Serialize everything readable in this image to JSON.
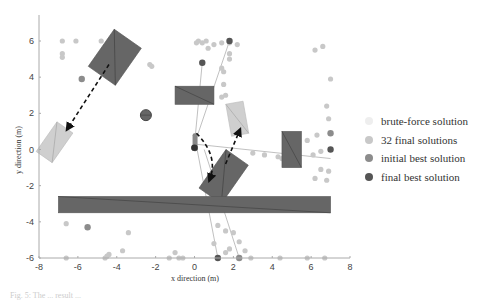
{
  "chart_data": {
    "type": "scatter",
    "title": "",
    "xlabel": "x direction (m)",
    "ylabel": "y direction (m)",
    "xlim": [
      -8,
      8
    ],
    "ylim": [
      -6,
      6
    ],
    "xticks": [
      "-8",
      "-6",
      "-4",
      "-2",
      "0",
      "2",
      "4",
      "6",
      "8"
    ],
    "yticks": [
      "-6",
      "-4",
      "-2",
      "0",
      "2",
      "4",
      "6"
    ],
    "grid": false,
    "legend_position": "right",
    "legend": [
      {
        "label": "brute-force solution",
        "color": "#eeeeee"
      },
      {
        "label": "32 final solutions",
        "color": "#c8c8c8"
      },
      {
        "label": "initial best solution",
        "color": "#8c8c8c"
      },
      {
        "label": "final best solution",
        "color": "#555555"
      }
    ],
    "series": [
      {
        "name": "32 final solutions",
        "points": [
          [
            -6.8,
            6.0
          ],
          [
            -6.1,
            6.0
          ],
          [
            -6.8,
            5.3
          ],
          [
            -6.8,
            5.1
          ],
          [
            -4.8,
            6.0
          ],
          [
            -4.3,
            6.0
          ],
          [
            -3.5,
            6.0
          ],
          [
            -2.3,
            4.7
          ],
          [
            -2.2,
            4.6
          ],
          [
            0.1,
            5.9
          ],
          [
            0.2,
            6.0
          ],
          [
            0.4,
            5.9
          ],
          [
            0.6,
            6.0
          ],
          [
            0.7,
            5.6
          ],
          [
            1.0,
            5.8
          ],
          [
            1.4,
            5.9
          ],
          [
            0.4,
            4.8
          ],
          [
            1.4,
            4.5
          ],
          [
            1.5,
            4.3
          ],
          [
            1.5,
            3.6
          ],
          [
            1.6,
            3.0
          ],
          [
            1.4,
            2.9
          ],
          [
            1.8,
            5.9
          ],
          [
            2.2,
            5.8
          ],
          [
            1.8,
            5.3
          ],
          [
            1.8,
            5.0
          ],
          [
            6.2,
            5.5
          ],
          [
            6.6,
            5.7
          ],
          [
            7.0,
            3.9
          ],
          [
            6.8,
            2.4
          ],
          [
            6.9,
            1.7
          ],
          [
            3.0,
            -0.2
          ],
          [
            3.6,
            -0.3
          ],
          [
            4.3,
            -0.4
          ],
          [
            4.5,
            -0.5
          ],
          [
            6.1,
            -0.3
          ],
          [
            6.5,
            -0.1
          ],
          [
            6.3,
            0.8
          ],
          [
            5.8,
            0.5
          ],
          [
            6.9,
            -1.2
          ],
          [
            6.8,
            -1.7
          ],
          [
            6.2,
            -1.6
          ],
          [
            6.5,
            -1.1
          ],
          [
            -6.6,
            -4.1
          ],
          [
            -3.4,
            -4.6
          ],
          [
            -3.7,
            -5.6
          ],
          [
            -4.4,
            -5.8
          ],
          [
            -4.5,
            -5.9
          ],
          [
            -1.0,
            -5.7
          ],
          [
            1.2,
            -4.2
          ],
          [
            1.6,
            -4.5
          ],
          [
            2.0,
            -4.6
          ],
          [
            1.0,
            -5.2
          ],
          [
            1.6,
            -5.7
          ],
          [
            2.3,
            -5.1
          ],
          [
            1.8,
            -5.5
          ],
          [
            2.6,
            -5.6
          ],
          [
            -1.3,
            -6.0
          ],
          [
            -0.8,
            -6.0
          ],
          [
            -0.6,
            -6.0
          ],
          [
            2.9,
            -6.0
          ],
          [
            4.4,
            -6.0
          ],
          [
            5.8,
            -6.0
          ],
          [
            6.7,
            -6.0
          ],
          [
            -6.6,
            -6.0
          ],
          [
            -4.6,
            -6.0
          ]
        ]
      },
      {
        "name": "initial best solution",
        "points": [
          [
            -5.8,
            3.9
          ],
          [
            -5.5,
            -4.3
          ],
          [
            2.3,
            -6.0
          ],
          [
            7.0,
            0.9
          ]
        ]
      },
      {
        "name": "final best solution",
        "points": [
          [
            0.4,
            4.8
          ],
          [
            1.8,
            6.0
          ],
          [
            1.2,
            -6.0
          ],
          [
            7.0,
            0.0
          ],
          [
            0.0,
            0.1
          ]
        ]
      }
    ],
    "annotations": {
      "obstacles_dark": [
        {
          "center": [
            -4.1,
            5.1
          ],
          "width": 1.7,
          "height": 2.5,
          "angle": 35
        },
        {
          "center": [
            0.0,
            3.0
          ],
          "width": 2.0,
          "height": 1.0,
          "angle": 0
        },
        {
          "center": [
            5.0,
            0.0
          ],
          "width": 1.0,
          "height": 2.0,
          "angle": 0
        },
        {
          "center": [
            1.5,
            -1.5
          ],
          "width": 1.4,
          "height": 2.6,
          "angle": 35
        },
        {
          "center": [
            0.0,
            -3.05
          ],
          "width": 14.0,
          "height": 0.9,
          "angle": 0
        },
        {
          "center": [
            -2.5,
            1.9
          ],
          "width": 0.4,
          "height": 0.4,
          "angle": 0
        }
      ],
      "targets_light": [
        {
          "center": [
            -7.2,
            0.4
          ],
          "width": 1.0,
          "height": 2.0,
          "angle": 35
        },
        {
          "center": [
            2.2,
            1.7
          ],
          "width": 0.9,
          "height": 1.8,
          "angle": -10
        }
      ],
      "dashed_arrows": [
        {
          "from": [
            -4.4,
            4.7
          ],
          "to": [
            -6.5,
            1.2
          ]
        },
        {
          "from": [
            0.1,
            0.9
          ],
          "to": [
            0.8,
            -1.6
          ]
        },
        {
          "from": [
            1.6,
            -0.8
          ],
          "to": [
            2.3,
            1.0
          ]
        }
      ]
    }
  },
  "caption": "Fig. 5: The  ...  result ..."
}
